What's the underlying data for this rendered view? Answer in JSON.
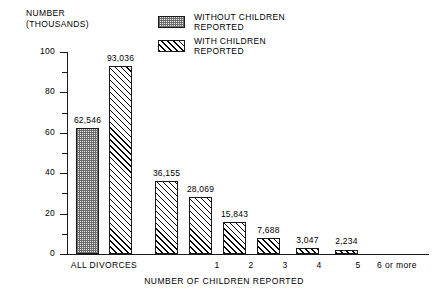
{
  "chart_data": {
    "type": "bar",
    "title": "",
    "xlabel": "NUMBER OF CHILDREN REPORTED",
    "ylabel": "NUMBER\n(THOUSANDS)",
    "ylabel_line1": "NUMBER",
    "ylabel_line2": "(THOUSANDS)",
    "categories": [
      "ALL DIVORCES",
      "ALL DIVORCES",
      "1",
      "2",
      "3",
      "4",
      "5",
      "6 or more"
    ],
    "ylim": [
      0,
      100
    ],
    "grid": false,
    "y_major_ticks": [
      0,
      20,
      40,
      60,
      80,
      100
    ],
    "y_minor_ticks": [
      10,
      30,
      50,
      70,
      90
    ],
    "y_tick_labels": [
      "0",
      "20",
      "40",
      "60",
      "80",
      "100"
    ],
    "legend_position": "top-center",
    "units_note": "values in thousands",
    "bars": [
      {
        "category": "ALL DIVORCES",
        "series": "WITHOUT CHILDREN REPORTED",
        "label": "62,546",
        "value": 62.546,
        "fill": "stippled"
      },
      {
        "category": "ALL DIVORCES",
        "series": "WITH CHILDREN REPORTED",
        "label": "93,036",
        "value": 93.036,
        "fill": "hatched"
      },
      {
        "category": "1",
        "series": "WITH CHILDREN REPORTED",
        "label": "36,155",
        "value": 36.155,
        "fill": "hatched"
      },
      {
        "category": "2",
        "series": "WITH CHILDREN REPORTED",
        "label": "28,069",
        "value": 28.069,
        "fill": "hatched"
      },
      {
        "category": "3",
        "series": "WITH CHILDREN REPORTED",
        "label": "15,843",
        "value": 15.843,
        "fill": "hatched"
      },
      {
        "category": "4",
        "series": "WITH CHILDREN REPORTED",
        "label": "7,688",
        "value": 7.688,
        "fill": "hatched"
      },
      {
        "category": "5",
        "series": "WITH CHILDREN REPORTED",
        "label": "3,047",
        "value": 3.047,
        "fill": "hatched"
      },
      {
        "category": "6 or more",
        "series": "WITH CHILDREN REPORTED",
        "label": "2,234",
        "value": 2.234,
        "fill": "hatched"
      }
    ],
    "legend": [
      {
        "label_line1": "WITHOUT CHILDREN",
        "label_line2": "REPORTED",
        "fill": "stippled"
      },
      {
        "label_line1": "WITH CHILDREN",
        "label_line2": "REPORTED",
        "fill": "hatched"
      }
    ],
    "colors": {
      "axis": "#1a1a1a",
      "text": "#000000",
      "background": "#ffffff",
      "hatch": "#000000",
      "stipple": "#6b6b6b"
    }
  }
}
